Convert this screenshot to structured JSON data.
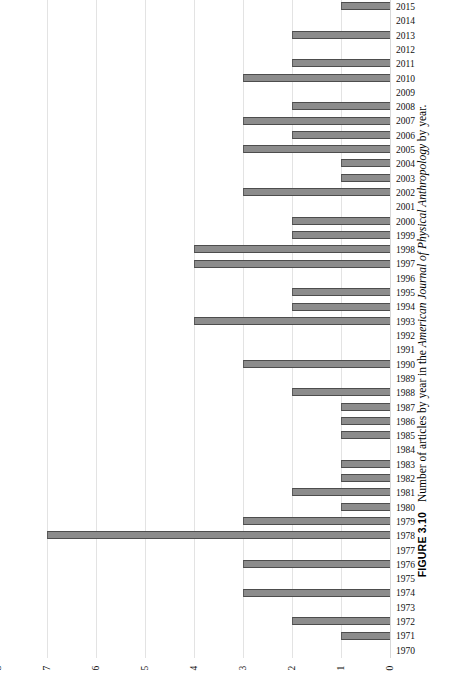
{
  "figure": {
    "label": "FIGURE 3.10",
    "caption_pre": "Number of articles by year in the ",
    "caption_italic": "American Journal of Physical Anthropology",
    "caption_post": " by year."
  },
  "axis": {
    "x_ticks": [
      "8",
      "7",
      "6",
      "5",
      "4",
      "3",
      "2",
      "1",
      "0"
    ],
    "x_direction": "reversed",
    "x_min": 0,
    "x_max": 8,
    "grid": true
  },
  "chart_data": {
    "type": "bar",
    "orientation": "horizontal",
    "title": "",
    "xlabel": "",
    "ylabel": "",
    "xlim": [
      0,
      8
    ],
    "grid": true,
    "legend": "none",
    "categories": [
      "2015",
      "2014",
      "2013",
      "2012",
      "2011",
      "2010",
      "2009",
      "2008",
      "2007",
      "2006",
      "2005",
      "2004",
      "2003",
      "2002",
      "2001",
      "2000",
      "1999",
      "1998",
      "1997",
      "1996",
      "1995",
      "1994",
      "1993",
      "1992",
      "1991",
      "1990",
      "1989",
      "1988",
      "1987",
      "1986",
      "1985",
      "1984",
      "1983",
      "1982",
      "1981",
      "1980",
      "1979",
      "1978",
      "1977",
      "1976",
      "1975",
      "1974",
      "1973",
      "1972",
      "1971",
      "1970"
    ],
    "values": [
      1,
      0,
      2,
      0,
      2,
      3,
      0,
      2,
      3,
      2,
      3,
      1,
      1,
      3,
      0,
      2,
      2,
      4,
      4,
      0,
      2,
      2,
      4,
      0,
      0,
      3,
      0,
      2,
      1,
      1,
      1,
      0,
      1,
      1,
      2,
      1,
      3,
      7,
      0,
      3,
      0,
      3,
      0,
      2,
      1,
      0
    ],
    "series": [
      {
        "name": "Number of articles",
        "values": [
          1,
          0,
          2,
          0,
          2,
          3,
          0,
          2,
          3,
          2,
          3,
          1,
          1,
          3,
          0,
          2,
          2,
          4,
          4,
          0,
          2,
          2,
          4,
          0,
          0,
          3,
          0,
          2,
          1,
          1,
          1,
          0,
          1,
          1,
          2,
          1,
          3,
          7,
          0,
          3,
          0,
          3,
          0,
          2,
          1,
          0
        ]
      }
    ]
  },
  "colors": {
    "bar_fill": "#8c8c8c",
    "bar_edge": "#4d4d4d",
    "grid": "#e3e3e3",
    "text": "#111111",
    "background": "#ffffff"
  }
}
